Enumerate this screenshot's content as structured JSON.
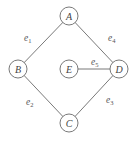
{
  "diagram": {
    "type": "undirected-graph",
    "nodes": [
      {
        "id": "A",
        "label": "A",
        "x": 69,
        "y": 16
      },
      {
        "id": "B",
        "label": "B",
        "x": 18,
        "y": 69
      },
      {
        "id": "E",
        "label": "E",
        "x": 69,
        "y": 69
      },
      {
        "id": "D",
        "label": "D",
        "x": 119,
        "y": 69
      },
      {
        "id": "C",
        "label": "C",
        "x": 69,
        "y": 123
      }
    ],
    "edges": [
      {
        "id": "e1",
        "label": "e",
        "sub": "1",
        "from": "A",
        "to": "B",
        "label_x": 24,
        "label_y": 41
      },
      {
        "id": "e4",
        "label": "e",
        "sub": "4",
        "from": "A",
        "to": "D",
        "label_x": 108,
        "label_y": 41
      },
      {
        "id": "e5",
        "label": "e",
        "sub": "5",
        "from": "E",
        "to": "D",
        "label_x": 91,
        "label_y": 65
      },
      {
        "id": "e2",
        "label": "e",
        "sub": "2",
        "from": "B",
        "to": "C",
        "label_x": 26,
        "label_y": 105
      },
      {
        "id": "e3",
        "label": "e",
        "sub": "3",
        "from": "C",
        "to": "D",
        "label_x": 106,
        "label_y": 103
      }
    ],
    "node_radius": 9,
    "colors": {
      "stroke": "#6a6a6a",
      "text": "#444444",
      "background": "#ffffff"
    }
  }
}
